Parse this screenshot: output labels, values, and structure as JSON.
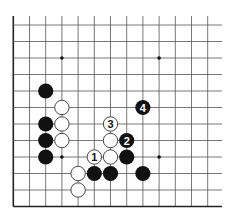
{
  "diagram": {
    "type": "go-board-fragment",
    "grid": {
      "columns": 13,
      "rows": 12,
      "origin_x": 13.3,
      "origin_y": 25,
      "spacing_x": 16.2,
      "spacing_y": 16.5,
      "top_y": 16,
      "right_x": 222,
      "edges": {
        "left": true,
        "bottom": true,
        "top": false,
        "right": false
      }
    },
    "colors": {
      "line": "#555555",
      "edge": "#222222",
      "black_stone": "#111111",
      "white_stone": "#ffffff",
      "white_stroke": "#333333"
    },
    "star_points": [
      {
        "col": 3,
        "row": 2
      },
      {
        "col": 9,
        "row": 2
      },
      {
        "col": 3,
        "row": 8
      },
      {
        "col": 9,
        "row": 8
      }
    ],
    "stones": [
      {
        "color": "black",
        "col": 2,
        "row": 4,
        "label": ""
      },
      {
        "color": "white",
        "col": 3,
        "row": 5,
        "label": ""
      },
      {
        "color": "black",
        "col": 2,
        "row": 6,
        "label": ""
      },
      {
        "color": "white",
        "col": 3,
        "row": 6,
        "label": ""
      },
      {
        "color": "black",
        "col": 2,
        "row": 7,
        "label": ""
      },
      {
        "color": "white",
        "col": 3,
        "row": 7,
        "label": ""
      },
      {
        "color": "black",
        "col": 2,
        "row": 8,
        "label": ""
      },
      {
        "color": "white",
        "col": 6,
        "row": 6,
        "label": "3"
      },
      {
        "color": "white",
        "col": 6,
        "row": 7,
        "label": ""
      },
      {
        "color": "black",
        "col": 7,
        "row": 7,
        "label": "2"
      },
      {
        "color": "black",
        "col": 8,
        "row": 5,
        "label": "4"
      },
      {
        "color": "white",
        "col": 5,
        "row": 8,
        "label": "1"
      },
      {
        "color": "white",
        "col": 6,
        "row": 8,
        "label": ""
      },
      {
        "color": "black",
        "col": 7,
        "row": 8,
        "label": ""
      },
      {
        "color": "white",
        "col": 4,
        "row": 9,
        "label": ""
      },
      {
        "color": "black",
        "col": 5,
        "row": 9,
        "label": ""
      },
      {
        "color": "black",
        "col": 6,
        "row": 9,
        "label": ""
      },
      {
        "color": "black",
        "col": 8,
        "row": 9,
        "label": ""
      },
      {
        "color": "white",
        "col": 4,
        "row": 10,
        "label": ""
      }
    ]
  }
}
